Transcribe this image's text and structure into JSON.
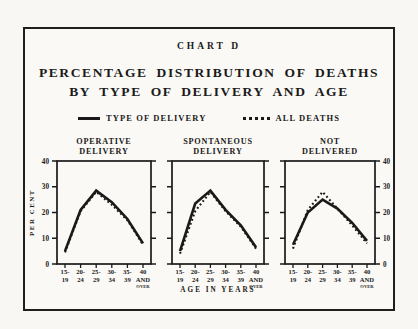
{
  "figure": {
    "chart_label": "CHART D",
    "title_line1": "PERCENTAGE DISTRIBUTION OF DEATHS",
    "title_line2": "BY TYPE OF DELIVERY AND AGE",
    "legend": [
      {
        "label": "TYPE OF DELIVERY",
        "style": "solid"
      },
      {
        "label": "ALL DEATHS",
        "style": "dotted"
      }
    ],
    "colors": {
      "ink": "#1a1a1a",
      "paper": "#faf9f5"
    }
  },
  "chart_data": {
    "type": "line",
    "categories": [
      "15-19",
      "20-24",
      "25-29",
      "30-34",
      "35-39",
      "40 and over"
    ],
    "category_labels": [
      [
        "15-",
        "19"
      ],
      [
        "20-",
        "24"
      ],
      [
        "25-",
        "29"
      ],
      [
        "30-",
        "34"
      ],
      [
        "35-",
        "39"
      ],
      [
        "40",
        "AND",
        "OVER"
      ]
    ],
    "xlabel": "AGE IN YEARS",
    "ylabel": "PER CENT",
    "ylim": [
      0,
      40
    ],
    "yticks": [
      0,
      10,
      20,
      30,
      40
    ],
    "grid": false,
    "legend_position": "top",
    "panels": [
      {
        "title": [
          "OPERATIVE",
          "DELIVERY"
        ],
        "series": [
          {
            "name": "TYPE OF DELIVERY",
            "style": "solid",
            "values": [
              5,
              21,
              28.5,
              24,
              17.5,
              8
            ]
          },
          {
            "name": "ALL DEATHS",
            "style": "dotted",
            "values": [
              4.5,
              20.5,
              28,
              23,
              17,
              7.5
            ]
          }
        ]
      },
      {
        "title": [
          "SPONTANEOUS",
          "DELIVERY"
        ],
        "series": [
          {
            "name": "TYPE OF DELIVERY",
            "style": "solid",
            "values": [
              5,
              23.5,
              28.5,
              21,
              15,
              6.5
            ]
          },
          {
            "name": "ALL DEATHS",
            "style": "dotted",
            "values": [
              4,
              20.5,
              28,
              20.5,
              14.5,
              6
            ]
          }
        ]
      },
      {
        "title": [
          "NOT",
          "DELIVERED"
        ],
        "series": [
          {
            "name": "TYPE OF DELIVERY",
            "style": "solid",
            "values": [
              7.5,
              20,
              25,
              21.5,
              16,
              9
            ]
          },
          {
            "name": "ALL DEATHS",
            "style": "dotted",
            "values": [
              6,
              21,
              28,
              21.5,
              15,
              8
            ]
          }
        ]
      }
    ]
  }
}
